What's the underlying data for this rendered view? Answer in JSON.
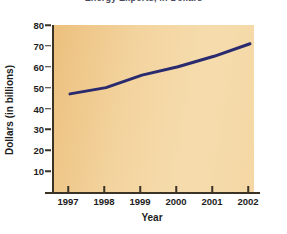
{
  "figure": {
    "title_partial": "Energy Exports, in Dollars",
    "background_color": "#ffffff",
    "plot_background_color": "#f2d099",
    "axis_color": "#3a3326",
    "line_color": "#2a2a6e"
  },
  "chart_data": {
    "type": "line",
    "title": "Energy Exports, in Dollars",
    "xlabel": "Year",
    "ylabel": "Dollars (in billions)",
    "categories": [
      "1997",
      "1998",
      "1999",
      "2000",
      "2001",
      "2002"
    ],
    "x": [
      1997,
      1998,
      1999,
      2000,
      2001,
      2002
    ],
    "values": [
      47,
      50,
      56,
      60,
      65,
      71
    ],
    "series": [
      {
        "name": "Dollars (in billions)",
        "values": [
          47,
          50,
          56,
          60,
          65,
          71
        ],
        "color": "#2a2a6e"
      }
    ],
    "ylim": [
      0,
      80
    ],
    "xlim": [
      1997,
      2002
    ],
    "yticks": [
      10,
      20,
      30,
      40,
      50,
      60,
      70,
      80
    ],
    "ytick_labels": [
      "10",
      "20",
      "30",
      "40",
      "50",
      "60",
      "70",
      "80"
    ],
    "xticks": [
      1997,
      1998,
      1999,
      2000,
      2001,
      2002
    ],
    "xtick_labels": [
      "1997",
      "1998",
      "1999",
      "2000",
      "2001",
      "2002"
    ],
    "grid": false,
    "legend": null,
    "legend_position": "none",
    "markers": false,
    "line_width": 3
  }
}
